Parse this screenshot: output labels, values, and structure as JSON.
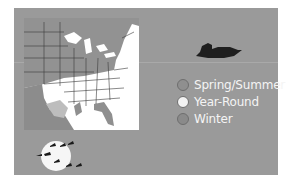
{
  "legend": {
    "items": [
      {
        "label": "Spring/Summer",
        "color": "#8f8f8f"
      },
      {
        "label": "Year-Round",
        "color": "#f2f2f2"
      },
      {
        "label": "Winter",
        "color": "#8a8a8a"
      }
    ]
  },
  "icons": {
    "map": "range-map-eastern-us",
    "bird": "duck-silhouette",
    "flock": "geese-flying-across-moon"
  },
  "colors": {
    "card_background": "#9a9a9a",
    "year_round": "#ffffff",
    "spring_summer": "#8f8f8f",
    "winter": "#b0b0b0"
  }
}
